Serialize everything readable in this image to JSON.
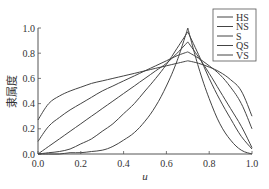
{
  "chart_data": {
    "type": "line",
    "title": "",
    "xlabel": "u",
    "ylabel": "隶属度",
    "xlim": [
      0.0,
      1.0
    ],
    "ylim": [
      0.0,
      1.0
    ],
    "grid": false,
    "legend_position": "upper right",
    "x_ticks": [
      "0.0",
      "0.2",
      "0.4",
      "0.6",
      "0.8",
      "1.0"
    ],
    "y_ticks": [
      "0.0",
      "0.2",
      "0.4",
      "0.6",
      "0.8",
      "1.0"
    ],
    "x": [
      0.0,
      0.05,
      0.1,
      0.15,
      0.2,
      0.25,
      0.3,
      0.35,
      0.4,
      0.45,
      0.5,
      0.55,
      0.6,
      0.65,
      0.7,
      0.75,
      0.8,
      0.85,
      0.9,
      0.95,
      1.0
    ],
    "series": [
      {
        "name": "HS",
        "values": [
          0.0,
          0.0,
          0.0,
          0.01,
          0.01,
          0.02,
          0.03,
          0.06,
          0.11,
          0.17,
          0.26,
          0.38,
          0.54,
          0.74,
          1.0,
          0.69,
          0.44,
          0.24,
          0.11,
          0.03,
          0.0
        ]
      },
      {
        "name": "NS",
        "values": [
          0.0,
          0.01,
          0.02,
          0.04,
          0.08,
          0.12,
          0.18,
          0.24,
          0.32,
          0.4,
          0.5,
          0.6,
          0.71,
          0.84,
          0.97,
          0.79,
          0.6,
          0.43,
          0.28,
          0.14,
          0.04
        ]
      },
      {
        "name": "S",
        "values": [
          0.0,
          0.06,
          0.12,
          0.18,
          0.24,
          0.3,
          0.36,
          0.42,
          0.48,
          0.54,
          0.6,
          0.66,
          0.72,
          0.8,
          0.89,
          0.77,
          0.64,
          0.5,
          0.36,
          0.22,
          0.05
        ]
      },
      {
        "name": "QS",
        "values": [
          0.1,
          0.22,
          0.29,
          0.35,
          0.4,
          0.45,
          0.5,
          0.54,
          0.58,
          0.62,
          0.66,
          0.7,
          0.74,
          0.78,
          0.81,
          0.76,
          0.7,
          0.63,
          0.53,
          0.4,
          0.2
        ]
      },
      {
        "name": "VS",
        "values": [
          0.27,
          0.4,
          0.46,
          0.5,
          0.53,
          0.56,
          0.58,
          0.6,
          0.62,
          0.64,
          0.66,
          0.68,
          0.7,
          0.72,
          0.74,
          0.72,
          0.69,
          0.65,
          0.59,
          0.5,
          0.3
        ]
      }
    ],
    "colors": {
      "line": "#444444",
      "axis": "#555555",
      "text": "#333333"
    }
  }
}
